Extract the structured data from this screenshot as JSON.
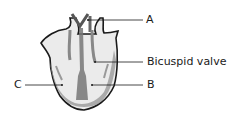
{
  "diagram": {
    "labels": {
      "a": "A",
      "bicuspid": "Bicuspid valve",
      "b": "B",
      "c": "C"
    }
  }
}
